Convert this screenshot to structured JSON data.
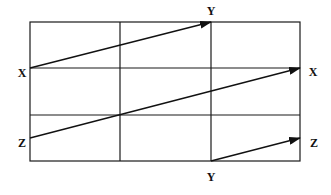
{
  "diagram": {
    "grid": {
      "left": 30,
      "top": 22,
      "right": 300,
      "bottom": 161,
      "vlines": [
        120,
        211
      ],
      "hlines": [
        68,
        115
      ],
      "stroke": "#1a1a1a"
    },
    "labels": {
      "top_y": "Y",
      "left_x": "X",
      "right_x": "X",
      "left_z": "Z",
      "right_z": "Z",
      "bottom_y": "Y"
    },
    "arrows": [
      {
        "from": "X (left)",
        "to": "Y (top)",
        "x1": 30,
        "y1": 68,
        "x2": 211,
        "y2": 22
      },
      {
        "from": "Z (left)",
        "to": "X (right)",
        "x1": 30,
        "y1": 138,
        "x2": 300,
        "y2": 68
      },
      {
        "from": "Y (bottom)",
        "to": "Z (right)",
        "x1": 211,
        "y1": 161,
        "x2": 300,
        "y2": 138
      }
    ]
  }
}
